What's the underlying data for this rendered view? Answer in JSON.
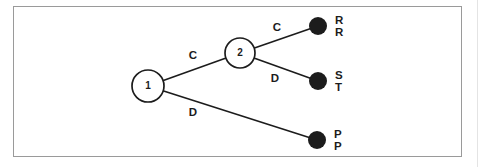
{
  "diagram": {
    "type": "game-tree",
    "colors": {
      "background": "#ffffff",
      "frame_border": "#9a9a9a",
      "line": "#1c1c1c",
      "decision_node_fill": "#ffffff",
      "terminal_node_fill": "#1c1c1c",
      "text": "#1c1c1c"
    },
    "decision_nodes": [
      {
        "id": "n1",
        "label": "1",
        "x": 148,
        "y": 86,
        "r": 16
      },
      {
        "id": "n2",
        "label": "2",
        "x": 240,
        "y": 53,
        "r": 15
      }
    ],
    "terminal_nodes": [
      {
        "id": "t1",
        "x": 318,
        "y": 26,
        "r": 9,
        "payoffs": [
          "R",
          "R"
        ]
      },
      {
        "id": "t2",
        "x": 318,
        "y": 81,
        "r": 9,
        "payoffs": [
          "S",
          "T"
        ]
      },
      {
        "id": "t3",
        "x": 317,
        "y": 140,
        "r": 9,
        "payoffs": [
          "P",
          "P"
        ]
      }
    ],
    "edges": [
      {
        "from": "n1",
        "to": "n2",
        "label": "C",
        "label_x": 193,
        "label_y": 56
      },
      {
        "from": "n2",
        "to": "t1",
        "label": "C",
        "label_x": 277,
        "label_y": 28
      },
      {
        "from": "n2",
        "to": "t2",
        "label": "D",
        "label_x": 275,
        "label_y": 79
      },
      {
        "from": "n1",
        "to": "t3",
        "label": "D",
        "label_x": 193,
        "label_y": 113
      }
    ],
    "style": {
      "line_width": 1.6,
      "node_stroke_width": 1.7,
      "node_label_font_size": 10,
      "edge_label_font_size": 11.5,
      "payoff_font_size": 11.5,
      "payoff_offset_x": 17,
      "payoff_dy_top": -5.5,
      "payoff_dy_bottom": 7
    }
  }
}
